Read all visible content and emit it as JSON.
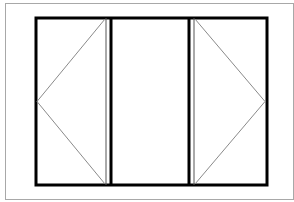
{
  "diagram": {
    "type": "window-elevation",
    "colors": {
      "background": "#ffffff",
      "outer_border": "#a8a8a8",
      "frame": "#000000",
      "inner_line": "#666666",
      "swing_line": "#8a8a8a"
    },
    "outer_border": {
      "x": 5,
      "y": 3,
      "width": 289,
      "height": 197
    },
    "frame": {
      "x": 35,
      "y": 17,
      "width": 233,
      "height": 169
    },
    "panels": [
      {
        "id": "left",
        "type": "casement",
        "hinge": "left",
        "x1": 35,
        "x2": 106
      },
      {
        "id": "center",
        "type": "fixed",
        "x1": 112,
        "x2": 189
      },
      {
        "id": "right",
        "type": "casement",
        "hinge": "right",
        "x1": 194,
        "x2": 268
      }
    ]
  }
}
